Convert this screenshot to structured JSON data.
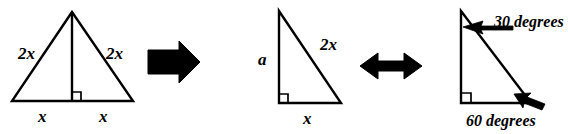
{
  "figure": {
    "ink_color": "#000000",
    "background_color": "#ffffff"
  },
  "panels": [
    {
      "id": "equilateral-triangle",
      "name": "equilateral triangle with altitude",
      "labels": {
        "left_side": "2x",
        "right_side": "2x",
        "base_left": "x",
        "base_right": "x"
      },
      "markers": [
        "right-angle-square"
      ]
    },
    {
      "id": "right-triangle-sides",
      "name": "right triangle with labeled sides",
      "labels": {
        "vertical_leg": "a",
        "hypotenuse": "2x",
        "horizontal_leg": "x"
      },
      "markers": [
        "right-angle-square"
      ]
    },
    {
      "id": "right-triangle-angles",
      "name": "right triangle with labeled angles",
      "labels": {
        "top_angle": "30 degrees",
        "bottom_angle": "60 degrees"
      },
      "markers": [
        "right-angle-square"
      ]
    }
  ],
  "connectors": [
    {
      "id": "arrow-1",
      "name": "thick right arrow",
      "glyph": "right-arrow"
    },
    {
      "id": "arrow-2",
      "name": "double headed arrow",
      "glyph": "left-right-arrow"
    }
  ]
}
